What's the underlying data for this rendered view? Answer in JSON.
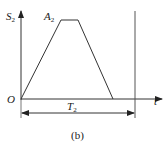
{
  "diagram": {
    "type": "trapezoidal-profile",
    "y_axis_label": "S",
    "y_axis_sub": "2",
    "x_axis_label": "t",
    "origin_label": "O",
    "peak_label": "A",
    "peak_sub": "2",
    "period_label": "T",
    "period_sub": "2",
    "caption": "(b)",
    "line_color": "#333333"
  }
}
